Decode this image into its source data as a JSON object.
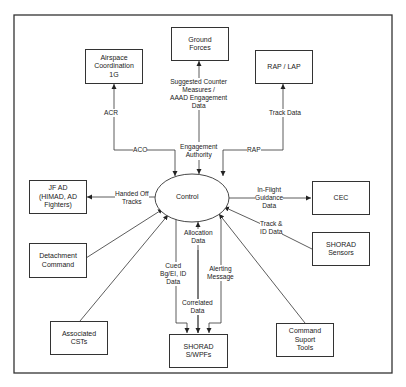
{
  "diagram": {
    "center_node": "Control",
    "nodes": {
      "airspace": "Airspace\nCoordination\n1G",
      "ground": "Ground\nForces",
      "rap_lap": "RAP / LAP",
      "jfad": "JF AD\n(HIMAD, AD\nFighters)",
      "cec": "CEC",
      "detachment": "Detachment\nCommand",
      "shorad_sensors": "SHORAD Sensors",
      "associated": "Associated CSTs",
      "shorad_wpfs": "SHORAD S/WPFs",
      "command_tools": "Command Suport\nTools"
    },
    "edges": {
      "acr": "ACR",
      "aco": "ACO",
      "suggested": "Suggested Counter\nMeasures /\nAAAD Engagement\nData",
      "engagement": "Engagement\nAuthority",
      "track_data": "Track Data",
      "rap": "RAP",
      "handed_off": "Handed Off\nTracks",
      "inflight": "In-Flight\nGuidance\nData",
      "track_id": "Track &\nID Data",
      "allocation": "Allocation\nData",
      "cued": "Cued\nBg/EI, ID\nData",
      "alerting": "Alerting\nMessage",
      "correlated": "Correlated\nData"
    }
  }
}
